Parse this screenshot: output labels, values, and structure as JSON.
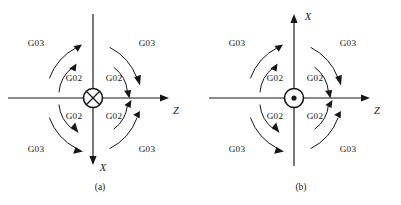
{
  "figure": {
    "background_color": "#ffffff",
    "ink_color": "#16161a",
    "panels": [
      {
        "id": "a",
        "caption": "(a)",
        "center_symbol": "crossed-circle",
        "center_symbol_meaning": "axis-into-page",
        "axes": [
          {
            "name": "z-axis",
            "label": "Z",
            "direction": "right",
            "label_x": 176,
            "label_y": 112
          },
          {
            "name": "x-axis",
            "label": "X",
            "direction": "down",
            "label_x": 103,
            "label_y": 172
          }
        ],
        "arc_labels": [
          {
            "code": "G03",
            "quadrant": "upper-left",
            "x": 36,
            "y": 44
          },
          {
            "code": "G02",
            "quadrant": "upper-left",
            "x": 74,
            "y": 79
          },
          {
            "code": "G03",
            "quadrant": "upper-right",
            "x": 147,
            "y": 44
          },
          {
            "code": "G02",
            "quadrant": "upper-right",
            "x": 114,
            "y": 79
          },
          {
            "code": "G02",
            "quadrant": "lower-left",
            "x": 74,
            "y": 117
          },
          {
            "code": "G03",
            "quadrant": "lower-left",
            "x": 36,
            "y": 150
          },
          {
            "code": "G02",
            "quadrant": "lower-right",
            "x": 114,
            "y": 117
          },
          {
            "code": "G03",
            "quadrant": "lower-right",
            "x": 147,
            "y": 150
          }
        ]
      },
      {
        "id": "b",
        "caption": "(b)",
        "center_symbol": "dotted-circle",
        "center_symbol_meaning": "axis-out-of-page",
        "axes": [
          {
            "name": "z-axis",
            "label": "Z",
            "direction": "right",
            "label_x": 176,
            "label_y": 112
          },
          {
            "name": "x-axis",
            "label": "X",
            "direction": "up",
            "label_x": 107,
            "label_y": 18
          }
        ],
        "arc_labels": [
          {
            "code": "G03",
            "quadrant": "upper-left",
            "x": 36,
            "y": 44
          },
          {
            "code": "G02",
            "quadrant": "upper-left",
            "x": 74,
            "y": 79
          },
          {
            "code": "G03",
            "quadrant": "upper-right",
            "x": 147,
            "y": 44
          },
          {
            "code": "G02",
            "quadrant": "upper-right",
            "x": 114,
            "y": 79
          },
          {
            "code": "G02",
            "quadrant": "lower-left",
            "x": 74,
            "y": 117
          },
          {
            "code": "G03",
            "quadrant": "lower-left",
            "x": 36,
            "y": 150
          },
          {
            "code": "G02",
            "quadrant": "lower-right",
            "x": 114,
            "y": 117
          },
          {
            "code": "G03",
            "quadrant": "lower-right",
            "x": 147,
            "y": 150
          }
        ]
      }
    ]
  }
}
